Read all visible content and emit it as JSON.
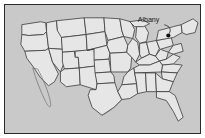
{
  "figure": {
    "kind": "map",
    "frame_border_color": "#2b2b2b",
    "background_color": "#c9c9c9",
    "land_fill_color": "#e6e6e6",
    "state_border_color": "#3a3a3a",
    "page_background": "#ffffff"
  },
  "annotations": {
    "city": {
      "label": "Albany",
      "label_color": "#1a1a1a",
      "marker_color": "#101010",
      "marker_x": 168,
      "marker_y": 32,
      "label_x": 150,
      "label_y": 17,
      "leader_color": "#2b2b2b"
    }
  },
  "map_geometry": {
    "note": "State polygons are layout, traced to match the rendered outline map.",
    "visible_features": [
      "contiguous-united-states",
      "state-borders",
      "great-lakes",
      "florida-peninsula",
      "baja-california-coast",
      "new-england"
    ]
  }
}
